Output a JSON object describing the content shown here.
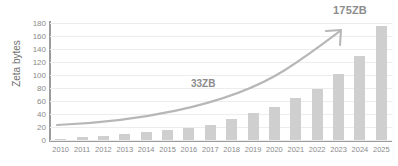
{
  "chart_data": {
    "type": "bar",
    "title": "",
    "xlabel": "",
    "ylabel": "Zeta bytes",
    "categories": [
      "2010",
      "2011",
      "2012",
      "2013",
      "2014",
      "2015",
      "2016",
      "2017",
      "2018",
      "2019",
      "2020",
      "2021",
      "2022",
      "2023",
      "2024",
      "2025"
    ],
    "values": [
      2,
      5,
      6,
      9,
      12,
      15,
      18,
      23,
      33,
      41,
      51,
      65,
      79,
      101,
      130,
      175
    ],
    "ylim": [
      0,
      180
    ],
    "ytick_labels": [
      "0",
      "20",
      "40",
      "60",
      "80",
      "100",
      "120",
      "140",
      "160",
      "180"
    ],
    "ytick_values": [
      0,
      20,
      40,
      60,
      80,
      100,
      120,
      140,
      160,
      180
    ],
    "grid": true,
    "legend": "none",
    "series_color": "#cfcfcf",
    "annotations": [
      {
        "name": "midpoint-callout",
        "text": "33ZB",
        "x_category": "2018",
        "value": 33
      },
      {
        "name": "endpoint-callout",
        "text": "175ZB",
        "x_category": "2025",
        "value": 175
      }
    ],
    "trend_arrow": {
      "description": "curved growth arrow rising from 2010 to 2025",
      "color": "#b7b7b7"
    }
  }
}
